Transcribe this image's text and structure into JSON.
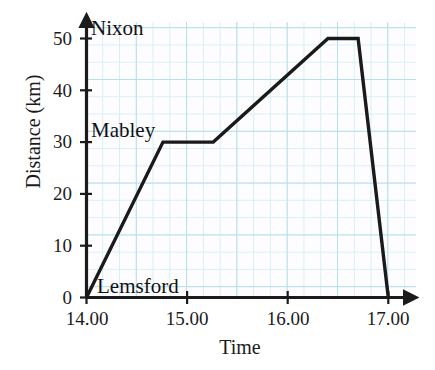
{
  "chart_data": {
    "type": "line",
    "title": "",
    "xlabel": "Time",
    "ylabel": "Distance (km)",
    "xtick_labels": [
      "14.00",
      "15.00",
      "16.00",
      "17.00"
    ],
    "xtick_values": [
      14.0,
      15.0,
      16.0,
      17.0
    ],
    "ytick_labels": [
      "0",
      "10",
      "20",
      "30",
      "40",
      "50"
    ],
    "ytick_values": [
      0,
      10,
      20,
      30,
      40,
      50
    ],
    "xlim": [
      14.0,
      17.3
    ],
    "ylim": [
      0,
      53
    ],
    "grid": true,
    "grid_style": "graph-paper-squares",
    "legend": "none",
    "series": [
      {
        "name": "journey",
        "x": [
          14.0,
          14.76,
          15.26,
          16.4,
          16.7,
          17.0
        ],
        "y": [
          0,
          30,
          30,
          50,
          50,
          0
        ]
      }
    ],
    "annotations": [
      {
        "text": "Nixon",
        "x": 14.05,
        "y": 50,
        "anchor": "left"
      },
      {
        "text": "Mabley",
        "x": 14.05,
        "y": 30,
        "anchor": "left"
      },
      {
        "text": "Lemsford",
        "x": 14.05,
        "y": 0,
        "anchor": "left"
      }
    ],
    "line_color": "#1a1a1a",
    "grid_color": "#b8dfe8",
    "axis_color": "#1b1b1b"
  }
}
